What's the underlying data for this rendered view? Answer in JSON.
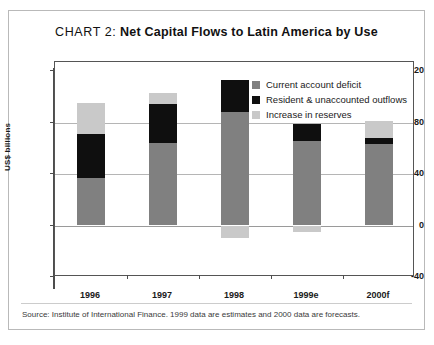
{
  "title": {
    "label": "CHART 2:",
    "headline": "Net Capital Flows to Latin America by Use"
  },
  "source_note": "Source: Institute of International Finance. 1999 data are estimates and 2000 data are forecasts.",
  "colors": {
    "current_account_deficit": "#808080",
    "resident_unaccounted_outflows": "#0f0f0f",
    "increase_in_reserves": "#c9c9c9",
    "frame": "#555555",
    "gridline": "#b5b5b5"
  },
  "legend": {
    "position": "top-right-inside",
    "items": [
      {
        "label": "Current account deficit",
        "color": "#808080"
      },
      {
        "label": "Resident & unaccounted outflows",
        "color": "#0f0f0f"
      },
      {
        "label": "Increase in reserves",
        "color": "#c9c9c9"
      }
    ]
  },
  "chart_data": {
    "type": "bar",
    "stacked": true,
    "title": "CHART 2: Net Capital Flows to Latin America by Use",
    "xlabel": "",
    "ylabel": "US$ billions",
    "ylim": [
      -40,
      120
    ],
    "yticks": [
      -40,
      0,
      40,
      80,
      120
    ],
    "ytick_labels": [
      "-40",
      "0",
      "40",
      "80",
      "120"
    ],
    "grid": true,
    "categories": [
      "1996",
      "1997",
      "1998",
      "1999e",
      "2000f"
    ],
    "series": [
      {
        "name": "Current account deficit",
        "color": "#808080",
        "values": [
          37,
          64,
          88,
          66,
          63
        ]
      },
      {
        "name": "Resident & unaccounted outflows",
        "color": "#0f0f0f",
        "values": [
          34,
          30,
          25,
          13,
          5
        ]
      },
      {
        "name": "Increase in reserves",
        "color": "#c9c9c9",
        "values": [
          24,
          9,
          -10,
          -5,
          13
        ]
      }
    ],
    "totals_positive": [
      95,
      103,
      113,
      79,
      81
    ],
    "annotations": []
  }
}
